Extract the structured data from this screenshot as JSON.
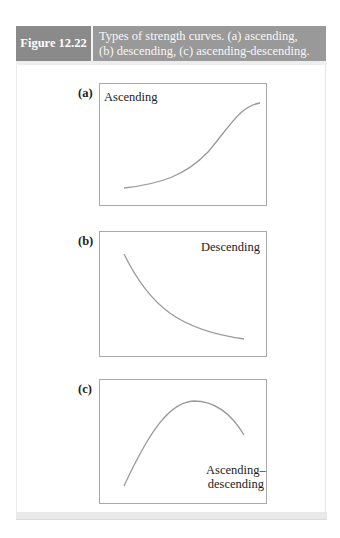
{
  "figure": {
    "label": "Figure 12.22",
    "caption_line1": "Types of strength curves. (a) ascending,",
    "caption_line2": "(b) descending, (c) ascending-descending."
  },
  "panels": [
    {
      "letter": "(a)",
      "curve_label": "Ascending"
    },
    {
      "letter": "(b)",
      "curve_label": "Descending"
    },
    {
      "letter": "(c)",
      "curve_label_line1": "Ascending–",
      "curve_label_line2": "descending"
    }
  ],
  "colors": {
    "label_bg": "#8a8a8a",
    "caption_bg": "#999999",
    "curve": "#9a9a9a",
    "box_border": "#a9a9a9"
  }
}
